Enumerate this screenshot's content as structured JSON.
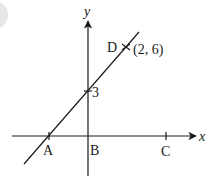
{
  "diagram": {
    "type": "coordinate-geometry",
    "axes": {
      "x_label": "x",
      "y_label": "y"
    },
    "line": {
      "through": [
        {
          "name": "A",
          "on": "x-axis"
        },
        {
          "name": "y-intercept",
          "value": "3"
        },
        {
          "name": "D",
          "coords": "(2, 6)"
        }
      ]
    },
    "points": {
      "A": {
        "label": "A"
      },
      "B": {
        "label": "B"
      },
      "C": {
        "label": "C"
      },
      "D": {
        "label": "D",
        "coords_label": "(2, 6)"
      }
    },
    "y_intercept_label": "3",
    "colors": {
      "ink": "#1a1a1a",
      "background": "#ffffff"
    }
  }
}
